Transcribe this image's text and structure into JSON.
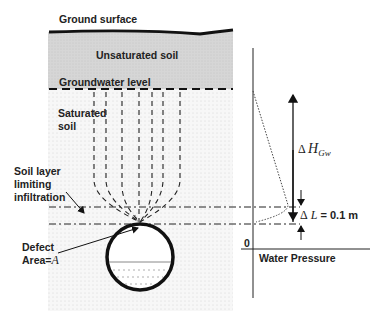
{
  "diagram": {
    "labels": {
      "ground_surface": "Ground surface",
      "unsaturated_soil": "Unsaturated soil",
      "groundwater_level": "Groundwater level",
      "saturated_soil_line1": "Saturated",
      "saturated_soil_line2": "soil",
      "soil_layer_line1": "Soil layer",
      "soil_layer_line2": "limiting",
      "soil_layer_line3": "infiltration",
      "defect_line1": "Defect",
      "defect_line2": "Area=",
      "defect_symbol": "A",
      "delta_h_symbol": "Δ",
      "delta_h_var": "H",
      "delta_h_sub": "Gw",
      "delta_l_symbol": "Δ",
      "delta_l_var": "L",
      "delta_l_value": " = 0.1 m",
      "zero": "0",
      "water_pressure": "Water Pressure"
    },
    "colors": {
      "unsaturated_fill": "#d9d9d9",
      "saturated_fill": "#f3f3f3",
      "line": "#111111"
    }
  }
}
